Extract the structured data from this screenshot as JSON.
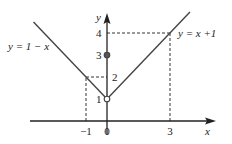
{
  "chart_data": {
    "type": "line",
    "title": "",
    "xlabel": "x",
    "ylabel": "y",
    "xlim": [
      -4.2,
      5.0
    ],
    "ylim": [
      -0.9,
      4.9
    ],
    "grid": false,
    "series": [
      {
        "name": "y = 1 − x",
        "label": "y = 1 − x",
        "domain": [
          -3.5,
          0
        ],
        "points": [
          [
            -3.5,
            4.5
          ],
          [
            0,
            1
          ]
        ]
      },
      {
        "name": "y = x +1",
        "label": "y = x +1",
        "domain": [
          0,
          3.95
        ],
        "points": [
          [
            0,
            1
          ],
          [
            3.95,
            4.95
          ]
        ]
      }
    ],
    "points": [
      {
        "name": "open-point",
        "x": 0,
        "y": 1,
        "filled": false
      },
      {
        "name": "filled-point",
        "x": 0,
        "y": 3,
        "filled": true
      }
    ],
    "guides": [
      {
        "from": [
          -1,
          0
        ],
        "to": [
          -1,
          2
        ]
      },
      {
        "from": [
          -1,
          2
        ],
        "to": [
          0,
          2
        ]
      },
      {
        "from": [
          0,
          4
        ],
        "to": [
          3,
          4
        ]
      },
      {
        "from": [
          3,
          4
        ],
        "to": [
          3,
          0
        ]
      }
    ],
    "x_ticks": [
      {
        "value": -1,
        "label": "−1"
      },
      {
        "value": 0,
        "label": "0"
      },
      {
        "value": 3,
        "label": "3"
      }
    ],
    "y_ticks": [
      {
        "value": 1,
        "label": "1"
      },
      {
        "value": 2,
        "label": "2"
      },
      {
        "value": 3,
        "label": "3"
      },
      {
        "value": 4,
        "label": "4"
      }
    ]
  }
}
